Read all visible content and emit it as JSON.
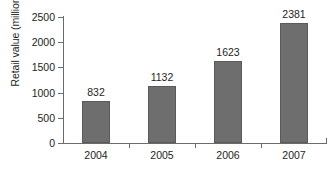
{
  "chart_data": {
    "type": "bar",
    "title": "",
    "subtitle": "",
    "xlabel": "",
    "ylabel": "Retail value (million €)",
    "categories": [
      "2004",
      "2005",
      "2006",
      "2007"
    ],
    "values": [
      832,
      1132,
      1623,
      2381
    ],
    "data_labels": [
      "832",
      "1132",
      "1623",
      "2381"
    ],
    "series": [
      {
        "name": "Retail value",
        "values": [
          832,
          1132,
          1623,
          2381
        ],
        "color": "#6e6e6e"
      }
    ],
    "ylim": [
      0,
      2500
    ],
    "yticks": [
      0,
      500,
      1000,
      1500,
      2000,
      2500
    ],
    "ytick_labels": [
      "0",
      "500",
      "1000",
      "1500",
      "2000",
      "2500"
    ],
    "grid": false,
    "legend": null,
    "legend_position": "none",
    "annotations": []
  },
  "style": {
    "bar_fill": "#6e6e6e",
    "bar_border": "#5a5a5a",
    "axis_color": "#6b6b6b",
    "text_color": "#1d1d1d",
    "background": "#ffffff"
  }
}
